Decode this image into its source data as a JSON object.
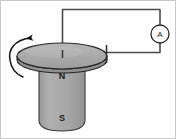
{
  "figure": {
    "name": "homopolar-generator-diagram",
    "background_color": "#ffffff",
    "border_color": "#b4b4b4"
  },
  "disc": {
    "name": "rotating-disc",
    "fill_color": "#a9a9a9",
    "edge_color": "#8c8c8c",
    "outline_color": "#262626",
    "center_x": 62,
    "center_y": 56,
    "radius_x": 45,
    "radius_y": 13,
    "thickness": 5
  },
  "magnet": {
    "name": "bar-magnet",
    "fill_color": "#a9a9a9",
    "outline_color": "#3a3a3a",
    "north_label": "N",
    "south_label": "S",
    "north_label_x": 62,
    "north_label_y": 76,
    "south_label_x": 62,
    "south_label_y": 119
  },
  "rotation_arrow": {
    "name": "rotation-arrow",
    "color": "#111111",
    "direction": "counterclockwise"
  },
  "circuit": {
    "name": "external-circuit",
    "wire_color": "#4a4a4a",
    "center_tap": {
      "name": "center-axle-contact",
      "x": 62,
      "y": 56
    },
    "rim_tap": {
      "name": "rim-brush-contact",
      "x": 107,
      "y": 52
    },
    "top_wire_y": 9,
    "right_wire_x": 160
  },
  "ammeter": {
    "name": "ammeter",
    "label": "A",
    "center_x": 160,
    "center_y": 34,
    "radius": 9,
    "outline_color": "#2a2a2a",
    "fill_color": "#ffffff"
  }
}
